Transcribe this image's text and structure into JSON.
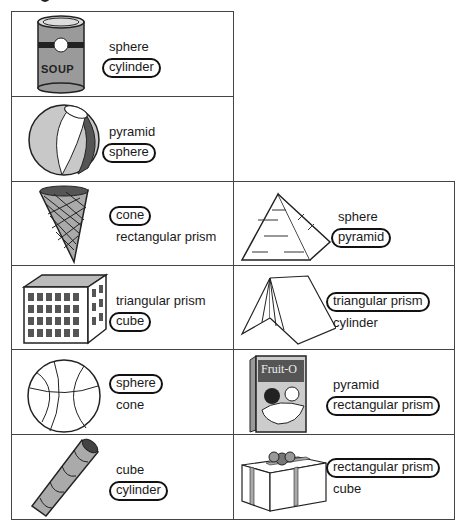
{
  "worksheet": {
    "heading_fragment": "g",
    "items": [
      {
        "picture": "soup-can",
        "options": [
          "sphere",
          "cylinder"
        ],
        "answer": "cylinder"
      },
      {
        "picture": "beach-ball",
        "options": [
          "pyramid",
          "sphere"
        ],
        "answer": "sphere"
      },
      {
        "picture": "ice-cream-cone",
        "options": [
          "cone",
          "rectangular prism"
        ],
        "answer": "cone"
      },
      {
        "picture": "pyramid",
        "options": [
          "sphere",
          "pyramid"
        ],
        "answer": "pyramid"
      },
      {
        "picture": "laundry-basket",
        "options": [
          "triangular prism",
          "cube"
        ],
        "answer": "cube"
      },
      {
        "picture": "tent",
        "options": [
          "triangular prism",
          "cylinder"
        ],
        "answer": "triangular prism"
      },
      {
        "picture": "basketball",
        "options": [
          "sphere",
          "cone"
        ],
        "answer": "sphere"
      },
      {
        "picture": "cereal-box",
        "box_label": "Fruit-O",
        "options": [
          "pyramid",
          "rectangular prism"
        ],
        "answer": "rectangular prism"
      },
      {
        "picture": "wafer-roll",
        "options": [
          "cube",
          "cylinder"
        ],
        "answer": "cylinder"
      },
      {
        "picture": "gift-box",
        "options": [
          "rectangular prism",
          "cube"
        ],
        "answer": "rectangular prism"
      }
    ],
    "can_label": "SOUP"
  }
}
